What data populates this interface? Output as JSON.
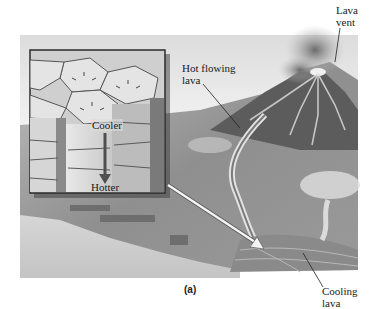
{
  "figure": {
    "caption": "(a)",
    "labels": {
      "lava_vent": [
        "Lava",
        "vent"
      ],
      "hot_flowing_lava": [
        "Hot flowing",
        "lava"
      ],
      "cooling_lava": [
        "Cooling",
        "lava"
      ]
    },
    "inset": {
      "top_label": "Cooler",
      "bottom_label": "Hotter"
    }
  },
  "colors": {
    "background": "#ffffff",
    "illustration_base": "#a8a8a8",
    "dark_shade": "#4a4a4a",
    "inset_border": "#2b2b2b",
    "arrow_white": "#f4f4f4"
  }
}
